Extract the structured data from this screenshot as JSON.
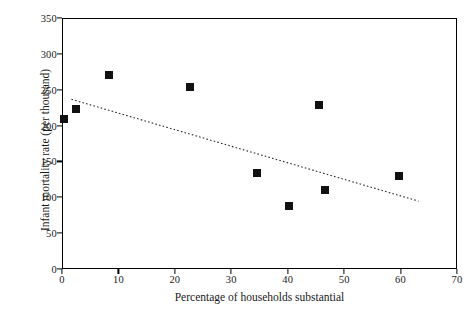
{
  "chart_data": {
    "type": "scatter",
    "title": "",
    "xlabel": "Percentage of households substantial",
    "ylabel": "Infant mortality rate (per thousand)",
    "xlim": [
      0,
      70
    ],
    "ylim": [
      0,
      350
    ],
    "xticks": [
      0,
      10,
      20,
      30,
      40,
      50,
      60,
      70
    ],
    "yticks": [
      0,
      50,
      100,
      150,
      200,
      250,
      300,
      350
    ],
    "grid": false,
    "legend": null,
    "marker_style": "filled-square",
    "marker_color": "#111111",
    "points": [
      {
        "x": 0.2,
        "y": 211
      },
      {
        "x": 2.3,
        "y": 225
      },
      {
        "x": 8.2,
        "y": 272
      },
      {
        "x": 22.5,
        "y": 255
      },
      {
        "x": 34.3,
        "y": 135
      },
      {
        "x": 40.0,
        "y": 89
      },
      {
        "x": 45.3,
        "y": 230
      },
      {
        "x": 46.5,
        "y": 112
      },
      {
        "x": 59.5,
        "y": 131
      }
    ],
    "trendline": {
      "style": "dotted",
      "color": "#2b2b2b",
      "x_start": 1.5,
      "y_start": 238,
      "x_end": 63.0,
      "y_end": 96
    }
  }
}
